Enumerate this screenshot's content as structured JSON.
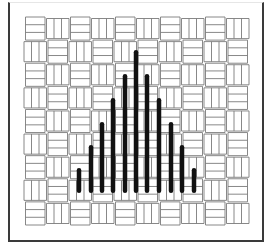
{
  "figure": {
    "colors": {
      "background": "#ffffff",
      "frame": "#3a3a3a",
      "weave_line": "#7a7a7a",
      "bar": "#111111"
    },
    "grid": {
      "x0": 24,
      "y0": 17,
      "x1": 249,
      "y1": 225,
      "cell": 11.5
    },
    "bars": {
      "count": 11,
      "bottom_y": 193,
      "width": 4.5,
      "x": [
        79,
        91,
        102,
        113,
        125,
        136,
        147,
        159,
        171,
        182,
        194
      ],
      "top_y": [
        168,
        145,
        122,
        98,
        74,
        50,
        74,
        98,
        122,
        145,
        168
      ]
    }
  }
}
